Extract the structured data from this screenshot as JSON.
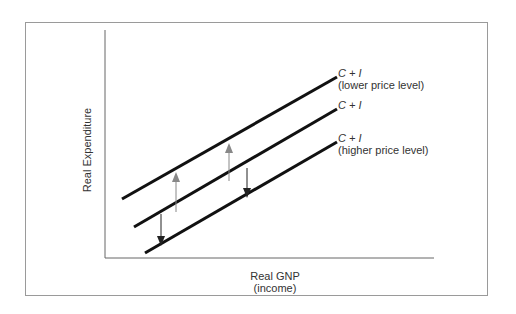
{
  "diagram": {
    "y_axis_label": "Real Expenditure",
    "x_axis_label": "Real GNP",
    "x_axis_sublabel": "(income)",
    "lines": [
      {
        "id": "lower",
        "label_main": "C + I",
        "label_sub": "(lower price level)"
      },
      {
        "id": "middle",
        "label_main": "C + I",
        "label_sub": ""
      },
      {
        "id": "higher",
        "label_main": "C + I",
        "label_sub": "(higher price level)"
      }
    ],
    "arrows": [
      {
        "direction": "up",
        "color": "#888888"
      },
      {
        "direction": "up",
        "color": "#888888"
      },
      {
        "direction": "down",
        "color": "#222222"
      },
      {
        "direction": "down",
        "color": "#222222"
      }
    ]
  }
}
